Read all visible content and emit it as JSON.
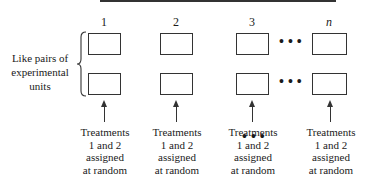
{
  "diagram": {
    "type": "matched-pairs-design",
    "columns": [
      {
        "label": "1",
        "italic": false
      },
      {
        "label": "2",
        "italic": false
      },
      {
        "label": "3",
        "italic": false
      },
      {
        "label": "n",
        "italic": true
      }
    ],
    "side_label": {
      "line1": "Like pairs of",
      "line2": "experimental",
      "line3": "units"
    },
    "treatment_label": {
      "line1": "Treatments",
      "line2": "1 and 2",
      "line3": "assigned",
      "line4": "at random"
    },
    "ellipsis": "•••",
    "colors": {
      "stroke": "#333333",
      "text": "#1a1a1a",
      "background": "#ffffff"
    }
  }
}
